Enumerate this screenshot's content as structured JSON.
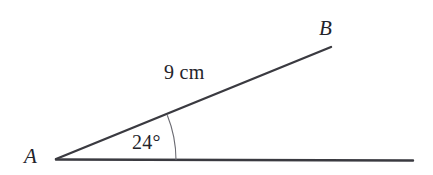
{
  "figure": {
    "kind": "geometry-angle-diagram",
    "background_color": "#ffffff",
    "stroke_color": "#3a3a40",
    "arc_color": "#6b6b72",
    "text_color": "#23232a",
    "labels": {
      "vertex_a": "A",
      "point_b": "B",
      "side_length": "9 cm",
      "angle_measure": "24°"
    },
    "geometry": {
      "vertex": {
        "x": 56,
        "y": 159
      },
      "ray_ab_end": {
        "x": 331,
        "y": 47
      },
      "ray_base_end": {
        "x": 413,
        "y": 160
      },
      "arc_radius": 120,
      "arc_start": {
        "x": 176,
        "y": 160
      },
      "arc_end": {
        "x": 167,
        "y": 115
      },
      "angle_degrees": 24,
      "segment_length_cm": 9
    }
  }
}
